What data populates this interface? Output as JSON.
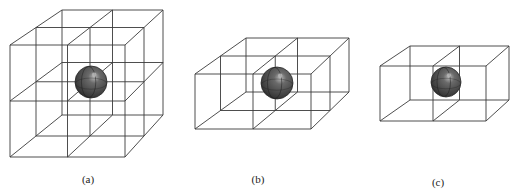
{
  "figure": {
    "panels": [
      {
        "id": "a",
        "label": "(a)",
        "label_pos": [
          88,
          173
        ],
        "divisions": {
          "x": 2,
          "y": 2,
          "z": 2
        },
        "corners": {
          "ftl": [
            10,
            45
          ],
          "ftr": [
            125,
            45
          ],
          "fbl": [
            10,
            157
          ],
          "fbr": [
            125,
            157
          ],
          "btl": [
            62,
            10
          ],
          "btr": [
            163,
            10
          ],
          "bbl": [
            62,
            115
          ],
          "bbr": [
            163,
            115
          ]
        },
        "sphere": {
          "cx": 91,
          "cy": 82,
          "r": 16
        }
      },
      {
        "id": "b",
        "label": "(b)",
        "label_pos": [
          258,
          173
        ],
        "divisions": {
          "x": 2,
          "y": 1,
          "z": 2
        },
        "corners": {
          "ftl": [
            195,
            74
          ],
          "ftr": [
            311,
            74
          ],
          "fbl": [
            195,
            129
          ],
          "fbr": [
            311,
            129
          ],
          "btl": [
            246,
            38
          ],
          "btr": [
            349,
            38
          ],
          "bbl": [
            246,
            92
          ],
          "bbr": [
            349,
            92
          ]
        },
        "sphere": {
          "cx": 277,
          "cy": 83,
          "r": 16
        }
      },
      {
        "id": "c",
        "label": "(c)",
        "label_pos": [
          438,
          176
        ],
        "divisions": {
          "x": 2,
          "y": 1,
          "z": 1
        },
        "corners": {
          "ftl": [
            380,
            66
          ],
          "ftr": [
            486,
            66
          ],
          "fbl": [
            380,
            121
          ],
          "fbr": [
            486,
            121
          ],
          "btl": [
            410,
            46
          ],
          "btr": [
            509,
            46
          ],
          "bbl": [
            410,
            100
          ],
          "bbr": [
            509,
            100
          ]
        },
        "sphere": {
          "cx": 446,
          "cy": 82,
          "r": 15
        }
      }
    ],
    "colors": {
      "line": "#3a3a3a",
      "sphere_dark": "#2a2a2a",
      "sphere_mid": "#5a5a5a",
      "sphere_highlight": "#b8b8b8"
    }
  }
}
